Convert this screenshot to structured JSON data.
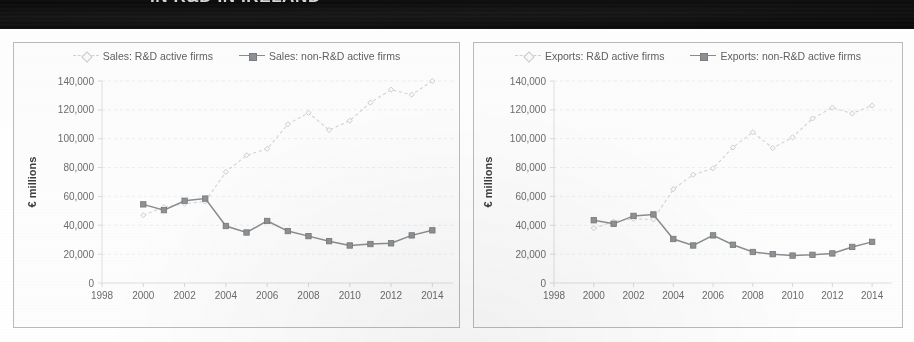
{
  "banner": {
    "text": "IN R&D IN IRELAND"
  },
  "charts": [
    {
      "id": "sales",
      "panel": "left",
      "legend": [
        {
          "label": "Sales: R&D active firms",
          "key_style": "dashed",
          "marker": "diamond-open"
        },
        {
          "label": "Sales: non-R&D active firms",
          "key_style": "solid",
          "marker": "square-filled"
        }
      ],
      "chart_data": {
        "type": "line",
        "title": "",
        "xlabel": "",
        "ylabel": "€ millions",
        "x": [
          2000,
          2001,
          2002,
          2003,
          2004,
          2005,
          2006,
          2007,
          2008,
          2009,
          2010,
          2011,
          2012,
          2013,
          2014
        ],
        "xlim": [
          1998,
          2015
        ],
        "xticks": [
          1998,
          2000,
          2002,
          2004,
          2006,
          2008,
          2010,
          2012,
          2014
        ],
        "ylim": [
          0,
          140000
        ],
        "yticks": [
          0,
          20000,
          40000,
          60000,
          80000,
          100000,
          120000,
          140000
        ],
        "ytick_labels": [
          "0",
          "20,000",
          "40,000",
          "60,000",
          "80,000",
          "100,000",
          "120,000",
          "140,000"
        ],
        "grid": true,
        "legend_position": "top",
        "series": [
          {
            "name": "Sales: R&D active firms",
            "style": "dashed",
            "marker": "diamond-open",
            "color": "#d2d4d5",
            "values": [
              47000,
              52500,
              55000,
              56500,
              77000,
              88500,
              93000,
              110000,
              118000,
              106000,
              112500,
              125000,
              134000,
              130500,
              140000
            ]
          },
          {
            "name": "Sales: non-R&D active firms",
            "style": "solid",
            "marker": "square-filled",
            "color": "#8b8e91",
            "values": [
              54500,
              50500,
              57000,
              58500,
              39500,
              35000,
              43000,
              36000,
              32500,
              29000,
              26000,
              27000,
              27500,
              33000,
              36500
            ]
          }
        ]
      }
    },
    {
      "id": "exports",
      "panel": "right",
      "legend": [
        {
          "label": "Exports: R&D active firms",
          "key_style": "dashed",
          "marker": "diamond-open"
        },
        {
          "label": "Exports: non-R&D active firms",
          "key_style": "solid",
          "marker": "square-filled"
        }
      ],
      "chart_data": {
        "type": "line",
        "title": "",
        "xlabel": "",
        "ylabel": "€ millions",
        "x": [
          2000,
          2001,
          2002,
          2003,
          2004,
          2005,
          2006,
          2007,
          2008,
          2009,
          2010,
          2011,
          2012,
          2013,
          2014
        ],
        "xlim": [
          1998,
          2015
        ],
        "xticks": [
          1998,
          2000,
          2002,
          2004,
          2006,
          2008,
          2010,
          2012,
          2014
        ],
        "ylim": [
          0,
          140000
        ],
        "yticks": [
          0,
          20000,
          40000,
          60000,
          80000,
          100000,
          120000,
          140000
        ],
        "ytick_labels": [
          "0",
          "20,000",
          "40,000",
          "60,000",
          "80,000",
          "100,000",
          "120,000",
          "140,000"
        ],
        "grid": true,
        "legend_position": "top",
        "series": [
          {
            "name": "Exports: R&D active firms",
            "style": "dashed",
            "marker": "diamond-open",
            "color": "#d2d4d5",
            "values": [
              38000,
              42500,
              44500,
              44000,
              65000,
              75000,
              79500,
              94000,
              104500,
              93500,
              101000,
              114000,
              121500,
              117500,
              123000
            ]
          },
          {
            "name": "Exports: non-R&D active firms",
            "style": "solid",
            "marker": "square-filled",
            "color": "#8b8e91",
            "values": [
              43500,
              41000,
              46500,
              47500,
              30500,
              26000,
              33000,
              26500,
              21500,
              20000,
              19000,
              19500,
              20500,
              25000,
              28500
            ]
          }
        ]
      }
    }
  ]
}
